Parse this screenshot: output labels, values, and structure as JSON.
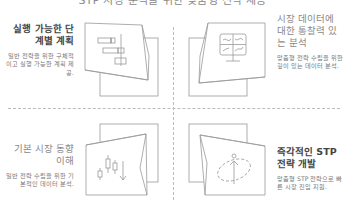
{
  "header": {
    "title": "STP 시장 분석을 위한 맞춤형 전략 제공"
  },
  "features": [
    {
      "title": "실행 가능한 단계별 계획",
      "description": "일반 전략을 위한 구체적이고 실행 가능한 계획 제공.",
      "icon": "gantt-chart-icon"
    },
    {
      "title": "시장 데이터에 대한 통찰력 있는 분석",
      "description": "맞춤형 전략 수립을 위한 깊이 있는 데이터 분석.",
      "icon": "monitor-charts-icon"
    },
    {
      "title": "기본 시장 동향 이해",
      "description": "일반 전략 수립을 위한 기본적인 데이터 분석.",
      "icon": "candlestick-down-icon"
    },
    {
      "title": "즉각적인 STP 전략 개발",
      "description": "맞춤형 STP 전략으로 빠른 시장 진입 지원.",
      "icon": "target-arrow-icon"
    }
  ],
  "colors": {
    "line": "#999999",
    "title_dark": "#444444",
    "title_light": "#888888",
    "text": "#777777",
    "divider": "#bbbbbb"
  }
}
